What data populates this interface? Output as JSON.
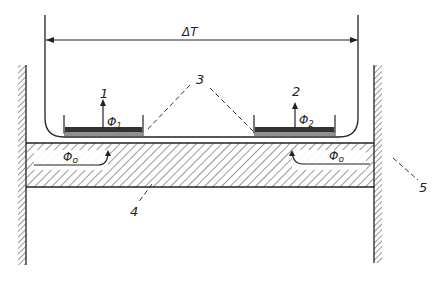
{
  "diagram": {
    "type": "technical-schematic",
    "dimension": {
      "label": "ΔT"
    },
    "callouts": [
      {
        "id": "1",
        "label": "1"
      },
      {
        "id": "2",
        "label": "2"
      },
      {
        "id": "3",
        "label": "3"
      },
      {
        "id": "4",
        "label": "4"
      },
      {
        "id": "5",
        "label": "5"
      }
    ],
    "fluxes": {
      "phi1": {
        "symbol": "Φ",
        "subscript": "1"
      },
      "phi2": {
        "symbol": "Φ",
        "subscript": "2"
      },
      "phi0_left": {
        "symbol": "Φ",
        "subscript": "o"
      },
      "phi0_right": {
        "symbol": "Φ",
        "subscript": "o"
      }
    },
    "colors": {
      "line": "#222222",
      "background": "#ffffff"
    }
  }
}
